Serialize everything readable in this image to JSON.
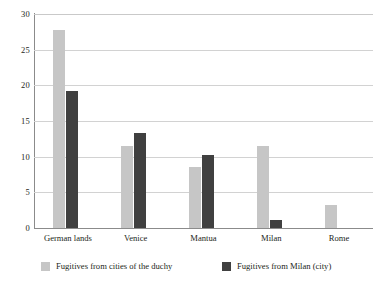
{
  "chart_data": {
    "type": "bar",
    "title": "",
    "subtitle": "",
    "xlabel": "",
    "ylabel": "",
    "ylim": [
      0,
      30
    ],
    "ytick_values": [
      0,
      5,
      10,
      15,
      20,
      25,
      30
    ],
    "ytick_labels": [
      "0",
      "5",
      "10",
      "15",
      "20",
      "25",
      "30"
    ],
    "grid": "horizontal",
    "legend_position": "bottom",
    "categories": [
      "German lands",
      "Venice",
      "Mantua",
      "Milan",
      "Rome"
    ],
    "series": [
      {
        "name": "Fugitives from cities of the duchy",
        "color": "#c6c6c6",
        "values": [
          27.7,
          11.5,
          8.6,
          11.5,
          3.2
        ]
      },
      {
        "name": "Fugitives from Milan (city)",
        "color": "#404040",
        "values": [
          19.2,
          13.3,
          10.2,
          1.1,
          0
        ]
      }
    ]
  },
  "axis": {
    "ticks": [
      "0",
      "5",
      "10",
      "15",
      "20",
      "25",
      "30"
    ]
  },
  "categories": {
    "labels": [
      "German lands",
      "Venice",
      "Mantua",
      "Milan",
      "Rome"
    ]
  },
  "legend": {
    "entries": [
      {
        "label": "Fugitives from cities of the duchy",
        "color": "#c6c6c6"
      },
      {
        "label": "Fugitives from Milan (city)",
        "color": "#404040"
      }
    ]
  },
  "colors": {
    "series_light": "#c6c6c6",
    "series_dark": "#404040",
    "gridline": "#d2d2d2",
    "axis": "#8b8b8b",
    "text": "#231f20",
    "background": "#ffffff"
  }
}
